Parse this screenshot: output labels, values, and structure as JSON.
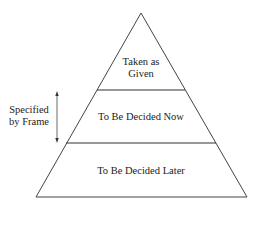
{
  "diagram": {
    "type": "pyramid",
    "levels": [
      {
        "label_line1": "Taken as",
        "label_line2": "Given"
      },
      {
        "label": "To Be Decided Now"
      },
      {
        "label": "To Be Decided Later"
      }
    ],
    "side_annotation": {
      "line1": "Specified",
      "line2": "by Frame",
      "arrow": "double-headed vertical"
    }
  }
}
